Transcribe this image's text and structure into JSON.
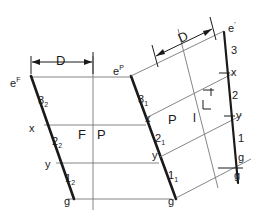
{
  "figure": {
    "type": "descriptive-geometry-construction",
    "stroke_color": "#1a1a1a",
    "thin_stroke_color": "#6e6e6e",
    "background_color": "#ffffff"
  },
  "dimensions": [
    {
      "id": "dim-left",
      "label": "D",
      "orientation": "horizontal"
    },
    {
      "id": "dim-right",
      "label": "D",
      "orientation": "oblique"
    }
  ],
  "field_labels": {
    "left_plane": "F",
    "left_plane_right": "P",
    "right_plane": "P",
    "right_plane_right": "l"
  },
  "lines": [
    {
      "id": "line-left",
      "endpoint_top": "e",
      "endpoint_top_sup": "F",
      "endpoint_bottom": "g",
      "segments": [
        {
          "label": "3",
          "sub": "2"
        },
        {
          "label": "2",
          "sub": "2"
        },
        {
          "label": "1",
          "sub": "2"
        }
      ],
      "points": [
        {
          "label": "x"
        },
        {
          "label": "y"
        }
      ]
    },
    {
      "id": "line-middle",
      "endpoint_top": "e",
      "endpoint_top_sup": "P",
      "endpoint_bottom": "g",
      "segments": [
        {
          "label": "3",
          "sub": "1"
        },
        {
          "label": "2",
          "sub": "1"
        },
        {
          "label": "1",
          "sub": "1"
        }
      ],
      "points": [
        {
          "label": "x"
        },
        {
          "label": "y"
        }
      ]
    },
    {
      "id": "line-right",
      "endpoint_top": "e",
      "endpoint_top_sup": "'",
      "endpoint_bottom": "g",
      "segments": [
        {
          "label": "3",
          "sub": ""
        },
        {
          "label": "2",
          "sub": ""
        },
        {
          "label": "1",
          "sub": ""
        }
      ],
      "points": [
        {
          "label": "x"
        },
        {
          "label": "y"
        }
      ]
    }
  ],
  "extra_marks": [
    {
      "id": "gamma-mark",
      "label": "Γ"
    },
    {
      "id": "bottom-right-g",
      "label": "g"
    }
  ]
}
